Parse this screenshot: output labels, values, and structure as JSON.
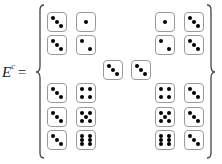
{
  "label": {
    "base": "E",
    "superscript": "c",
    "equals": "="
  },
  "colors": {
    "pip": "#000000",
    "die_border": "#9a9a9a",
    "brace": "#444444"
  },
  "set_description": "Complement of event E: pairs of dice outcomes",
  "dice_pairs": [
    {
      "group": "top-left",
      "row": 0,
      "values": [
        3,
        1
      ],
      "x": [
        47,
        76
      ],
      "y": 12
    },
    {
      "group": "top-left",
      "row": 1,
      "values": [
        3,
        2
      ],
      "x": [
        47,
        76
      ],
      "y": 35
    },
    {
      "group": "top-right",
      "row": 0,
      "values": [
        1,
        3
      ],
      "x": [
        155,
        184
      ],
      "y": 12
    },
    {
      "group": "top-right",
      "row": 1,
      "values": [
        2,
        3
      ],
      "x": [
        155,
        184
      ],
      "y": 35
    },
    {
      "group": "middle",
      "row": 0,
      "values": [
        3,
        3
      ],
      "x": [
        103,
        131
      ],
      "y": 60
    },
    {
      "group": "bottom-left",
      "row": 0,
      "values": [
        3,
        4
      ],
      "x": [
        47,
        76
      ],
      "y": 83
    },
    {
      "group": "bottom-left",
      "row": 1,
      "values": [
        3,
        5
      ],
      "x": [
        47,
        76
      ],
      "y": 107
    },
    {
      "group": "bottom-left",
      "row": 2,
      "values": [
        3,
        6
      ],
      "x": [
        47,
        76
      ],
      "y": 130
    },
    {
      "group": "bottom-right",
      "row": 0,
      "values": [
        4,
        3
      ],
      "x": [
        155,
        184
      ],
      "y": 83
    },
    {
      "group": "bottom-right",
      "row": 1,
      "values": [
        5,
        3
      ],
      "x": [
        155,
        184
      ],
      "y": 107
    },
    {
      "group": "bottom-right",
      "row": 2,
      "values": [
        6,
        3
      ],
      "x": [
        155,
        184
      ],
      "y": 130
    }
  ]
}
